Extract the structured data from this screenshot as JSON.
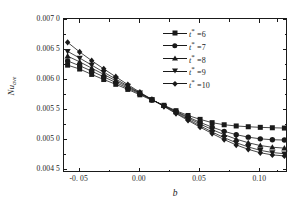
{
  "chart_data": {
    "type": "line",
    "title": "",
    "xlabel": "b",
    "ylabel": "Nu_ave",
    "ylabel_main": "Nu",
    "ylabel_sub": "ave",
    "xlim": [
      -0.063,
      0.123
    ],
    "ylim": [
      0.00445,
      0.00702
    ],
    "grid": false,
    "legend_position": "top-right-inside",
    "x_ticks": [
      -0.05,
      0.0,
      0.05,
      0.1
    ],
    "x_tick_labels": [
      "-0. 05",
      "0.00",
      "0.05",
      "0.10"
    ],
    "x_minor_ticks": [
      -0.025,
      0.025,
      0.075,
      0.115
    ],
    "y_ticks": [
      0.007,
      0.0065,
      0.006,
      0.0055,
      0.005,
      0.0045
    ],
    "y_tick_labels": [
      "0.007 0",
      "0.006 5",
      "0.006 0",
      "0.005 5",
      "0.005 0",
      "0.004 5"
    ],
    "x": [
      -0.06,
      -0.05,
      -0.04,
      -0.03,
      -0.02,
      -0.01,
      0.0,
      0.01,
      0.02,
      0.03,
      0.04,
      0.05,
      0.06,
      0.07,
      0.08,
      0.09,
      0.1,
      0.11,
      0.12
    ],
    "series": [
      {
        "name": "t* =6",
        "marker": "square",
        "color": "#1a1a1a",
        "values": [
          0.00625,
          0.006185,
          0.006095,
          0.00601,
          0.00593,
          0.005845,
          0.005755,
          0.005665,
          0.00558,
          0.00549,
          0.00541,
          0.005345,
          0.00529,
          0.005255,
          0.005235,
          0.005222,
          0.005212,
          0.005205,
          0.0052
        ]
      },
      {
        "name": "t* =7",
        "marker": "circle",
        "color": "#1a1a1a",
        "values": [
          0.00632,
          0.00624,
          0.00615,
          0.006055,
          0.00596,
          0.005865,
          0.00577,
          0.005672,
          0.005575,
          0.005478,
          0.005385,
          0.005295,
          0.005215,
          0.005145,
          0.00509,
          0.005048,
          0.00502,
          0.005005,
          0.005
        ]
      },
      {
        "name": "t* =8",
        "marker": "triangle-up",
        "color": "#1a1a1a",
        "values": [
          0.0064,
          0.006305,
          0.0062,
          0.006095,
          0.00599,
          0.005885,
          0.00578,
          0.005675,
          0.005572,
          0.005468,
          0.005368,
          0.005268,
          0.005175,
          0.00509,
          0.005015,
          0.004955,
          0.004908,
          0.00488,
          0.004865
        ]
      },
      {
        "name": "t* =9",
        "marker": "triangle-down",
        "color": "#1a1a1a",
        "values": [
          0.00648,
          0.006368,
          0.00625,
          0.006132,
          0.006018,
          0.005902,
          0.005788,
          0.005676,
          0.005565,
          0.005455,
          0.005345,
          0.005238,
          0.005135,
          0.00504,
          0.004955,
          0.004885,
          0.004828,
          0.004792,
          0.004772
        ]
      },
      {
        "name": "t* =10",
        "marker": "diamond",
        "color": "#1a1a1a",
        "values": [
          0.00663,
          0.00647,
          0.006325,
          0.006188,
          0.006055,
          0.005925,
          0.005798,
          0.005678,
          0.00556,
          0.005442,
          0.005328,
          0.005215,
          0.005108,
          0.005008,
          0.004918,
          0.004845,
          0.004788,
          0.004752,
          0.004735
        ]
      }
    ]
  },
  "legend": {
    "entries": [
      {
        "label_var": "t",
        "star": "*",
        "eq": "=6"
      },
      {
        "label_var": "t",
        "star": "*",
        "eq": "=7"
      },
      {
        "label_var": "t",
        "star": "*",
        "eq": "=8"
      },
      {
        "label_var": "t",
        "star": "*",
        "eq": "=9"
      },
      {
        "label_var": "t",
        "star": "*",
        "eq": "=10"
      }
    ]
  }
}
